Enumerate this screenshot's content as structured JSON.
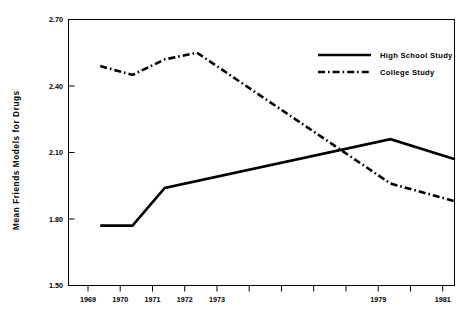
{
  "chart_data": {
    "type": "line",
    "title": "",
    "xlabel": "",
    "ylabel": "Mean Friends Models for Drugs",
    "x": [
      1969,
      1970,
      1971,
      1972,
      1973,
      1974,
      1975,
      1976,
      1977,
      1978,
      1979,
      1980,
      1981
    ],
    "xtick_labels": [
      "1969",
      "1970",
      "1971",
      "1972",
      "1973",
      "",
      "",
      "",
      "",
      "",
      "1979",
      "",
      "1981"
    ],
    "ytick_labels": [
      "1.50",
      "1.80",
      "2.10",
      "2.40",
      "2.70"
    ],
    "yticks": [
      1.5,
      1.8,
      2.1,
      2.4,
      2.7
    ],
    "ylim": [
      1.5,
      2.7
    ],
    "xlim": [
      1969,
      1981
    ],
    "grid": false,
    "legend_position": "top-right",
    "series": [
      {
        "name": "High School Study",
        "style": "solid",
        "color": "#000000",
        "x": [
          1970,
          1971,
          1972,
          1979,
          1981
        ],
        "values": [
          1.77,
          1.77,
          1.94,
          2.16,
          2.07
        ]
      },
      {
        "name": "College Study",
        "style": "dash-dot",
        "color": "#000000",
        "x": [
          1970,
          1971,
          1972,
          1973,
          1979,
          1981
        ],
        "values": [
          2.49,
          2.45,
          2.52,
          2.55,
          1.96,
          1.88
        ]
      }
    ]
  },
  "axis": {
    "y_title": "Mean Friends Models for Drugs",
    "y_labels": {
      "t0": "1.50",
      "t1": "1.80",
      "t2": "2.10",
      "t3": "2.40",
      "t4": "2.70"
    },
    "x_labels": {
      "x1969": "1969",
      "x1970": "1970",
      "x1971": "1971",
      "x1972": "1972",
      "x1973": "1973",
      "x1979": "1979",
      "x1981": "1981"
    }
  },
  "legend": {
    "items": [
      {
        "label": "High School Study",
        "style": "solid"
      },
      {
        "label": "College Study",
        "style": "dash-dot"
      }
    ]
  }
}
